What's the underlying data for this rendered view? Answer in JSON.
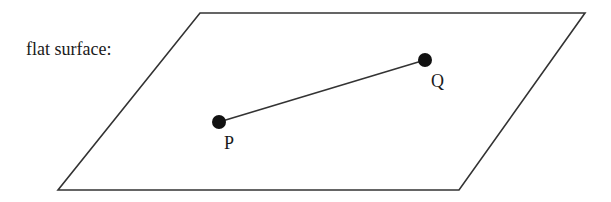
{
  "diagram": {
    "surface_label": "flat surface:",
    "surface": {
      "shape": "parallelogram",
      "vertices": [
        [
          200,
          13
        ],
        [
          585,
          13
        ],
        [
          459,
          190
        ],
        [
          58,
          190
        ]
      ],
      "stroke": "#333333"
    },
    "points": [
      {
        "name": "P",
        "label": "P",
        "x": 219,
        "y": 122,
        "label_x": 224,
        "label_y": 136
      },
      {
        "name": "Q",
        "label": "Q",
        "x": 425,
        "y": 60,
        "label_x": 431,
        "label_y": 74
      }
    ],
    "segment": {
      "from": "P",
      "to": "Q"
    },
    "colors": {
      "line": "#333333",
      "point": "#111111",
      "text": "#1a1a1a",
      "background": "#ffffff"
    }
  }
}
